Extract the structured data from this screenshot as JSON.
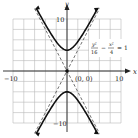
{
  "chart_data": {
    "type": "line",
    "title": "",
    "equation": {
      "lhs_term1_num": "y²",
      "lhs_term1_den": "16",
      "minus": "−",
      "lhs_term2_num": "x²",
      "lhs_term2_den": "4",
      "rhs": "= 1"
    },
    "xlabel": "x",
    "ylabel": "y",
    "xlim": [
      -10,
      10
    ],
    "ylim": [
      -10,
      10
    ],
    "grid": true,
    "grid_step": 2,
    "tick_labels": {
      "x_neg": "−10",
      "x_pos": "10",
      "y_pos": "10",
      "y_neg": "−10"
    },
    "annotations": [
      {
        "text": "(0, 0)",
        "x": 0,
        "y": 0
      }
    ],
    "series": [
      {
        "name": "hyperbola upper branch",
        "style": "solid",
        "function": "y = 4*sqrt(1 + x^2/4)",
        "x_range": [
          -5.66,
          5.66
        ]
      },
      {
        "name": "hyperbola lower branch",
        "style": "solid",
        "function": "y = -4*sqrt(1 + x^2/4)",
        "x_range": [
          -5.66,
          5.66
        ]
      },
      {
        "name": "asymptote y = 2x",
        "style": "dashed",
        "function": "y = 2x",
        "x_range": [
          -6,
          6
        ]
      },
      {
        "name": "asymptote y = -2x",
        "style": "dashed",
        "function": "y = -2x",
        "x_range": [
          -6,
          6
        ]
      }
    ],
    "vertices": [
      [
        0,
        4
      ],
      [
        0,
        -4
      ]
    ],
    "center": [
      0,
      0
    ]
  }
}
